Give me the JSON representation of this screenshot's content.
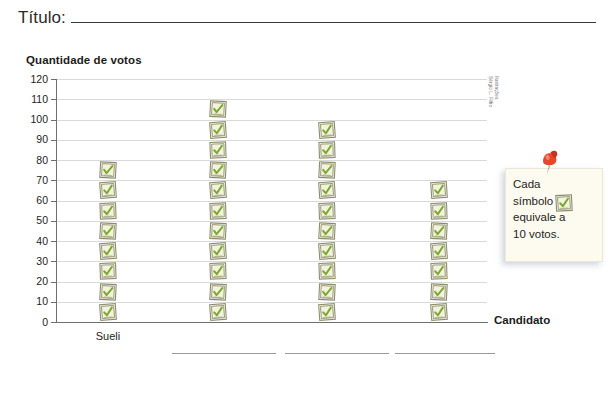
{
  "title": {
    "label": "Título:",
    "blank_rule": true
  },
  "credit": {
    "line1": "Ilustrações:",
    "line2": "Sérgio L. Filho"
  },
  "legend": {
    "line1": "Cada",
    "line2": "símbolo",
    "line3": "equivale a",
    "line4": "10 votos.",
    "full_text": "Cada símbolo ☑ equivale a 10 votos.",
    "symbol_name": "ballot-box-with-check",
    "pin_name": "pushpin-icon",
    "pin_color": "#e8462b",
    "box_bg": "#fdfbef"
  },
  "chart_data": {
    "type": "bar",
    "subtype": "pictogram",
    "title": "",
    "xlabel": "Candidato",
    "ylabel": "Quantidade de votos",
    "categories": [
      "Sueli",
      "",
      "",
      ""
    ],
    "values": [
      80,
      110,
      100,
      70
    ],
    "symbol_counts": [
      8,
      11,
      10,
      7
    ],
    "symbol_value": 10,
    "symbol_unit": "votos",
    "ylim": [
      0,
      120
    ],
    "ytick_step": 10,
    "yticks": [
      "120",
      "110",
      "100",
      "90",
      "80",
      "70",
      "60",
      "50",
      "40",
      "30",
      "20",
      "10",
      "0"
    ],
    "grid": true,
    "legend": "Cada símbolo equivale a 10 votos.",
    "legend_position": "right",
    "symbol_colors": {
      "fill": "#f3f3dc",
      "check": "#7aa832",
      "outline": "#8d8d6d"
    }
  },
  "answer_lines": {
    "count": 3,
    "note": "blank rules for writing candidate names"
  }
}
